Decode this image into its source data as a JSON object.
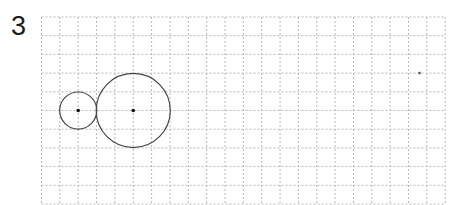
{
  "problem": {
    "number": "3"
  },
  "grid": {
    "origin_x": 41.5,
    "origin_y": 17,
    "cell_w": 18.35,
    "cell_h": 18.7,
    "columns": 22,
    "rows": 10.3,
    "line_color": "#b8b8b8"
  },
  "figure": {
    "stroke_color": "#444444",
    "dot_color": "#111111",
    "circles": [
      {
        "name": "small-circle",
        "col": 2,
        "row": 5,
        "radius_units": 1
      },
      {
        "name": "large-circle",
        "col": 5,
        "row": 5,
        "radius_units": 2
      }
    ],
    "points": [
      {
        "name": "small-circle-center",
        "col": 2,
        "row": 5,
        "size": 3
      },
      {
        "name": "large-circle-center",
        "col": 5,
        "row": 5,
        "size": 3
      },
      {
        "name": "lone-point",
        "col": 20.6,
        "row": 3,
        "size": 2
      }
    ]
  }
}
